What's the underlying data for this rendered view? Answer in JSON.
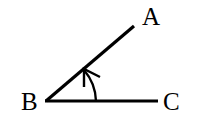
{
  "diagram": {
    "type": "angle",
    "points": {
      "A": {
        "label": "A",
        "x": 134,
        "y": 26
      },
      "B": {
        "label": "B",
        "x": 46,
        "y": 101
      },
      "C": {
        "label": "C",
        "x": 158,
        "y": 101
      }
    },
    "segments": [
      {
        "from": "B",
        "to": "A"
      },
      {
        "from": "B",
        "to": "C"
      }
    ],
    "arc": {
      "center": "B",
      "radius": 50,
      "from_ray": "BC",
      "to_ray": "BA",
      "arrow": "end"
    },
    "colors": {
      "stroke": "#000000",
      "background": "#ffffff"
    }
  }
}
